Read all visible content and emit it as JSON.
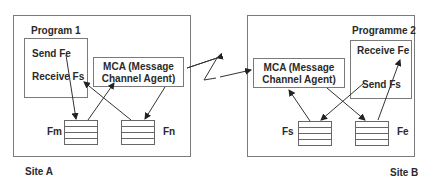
{
  "site_a": {
    "label": "Site A",
    "program": {
      "title": "Program 1",
      "send": "Send Fe",
      "receive": "Receive Fs"
    },
    "mca": {
      "line1": "MCA (Message",
      "line2": "Channel Agent)"
    },
    "queues": [
      {
        "label": "Fm"
      },
      {
        "label": "Fn"
      }
    ]
  },
  "site_b": {
    "label": "Site B",
    "program": {
      "title": "Programme 2",
      "receive": "Receive Fe",
      "send": "Send Fs"
    },
    "mca": {
      "line1": "MCA (Message",
      "line2": "Channel Agent)"
    },
    "queues": [
      {
        "label": "Fs"
      },
      {
        "label": "Fe"
      }
    ]
  },
  "link": {
    "type": "network-lightning"
  },
  "colors": {
    "stroke": "#333333",
    "box": "#7a7a7a",
    "text": "#2a2a2a"
  }
}
